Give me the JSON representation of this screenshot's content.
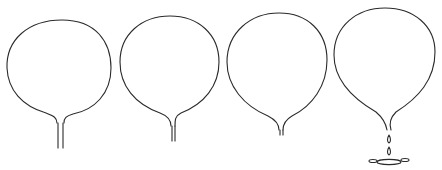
{
  "figure": {
    "stroke_color": "#2a2a2a",
    "background": "#ffffff",
    "stages": [
      {
        "index": 1,
        "name": "round-balloon-with-stem"
      },
      {
        "index": 2,
        "name": "slightly-elongated-balloon"
      },
      {
        "index": 3,
        "name": "tapered-balloon-pinching"
      },
      {
        "index": 4,
        "name": "droplet-falling-with-splash"
      }
    ]
  }
}
